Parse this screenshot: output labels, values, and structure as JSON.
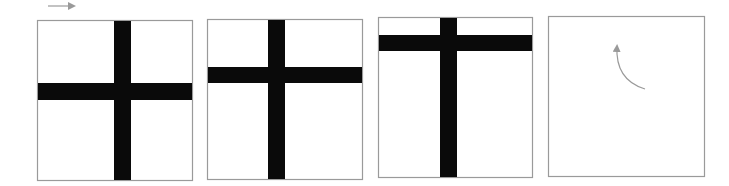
{
  "diagram": {
    "colors": {
      "background": "#ffffff",
      "panel_border": "#9a9a9a",
      "bar": "#0a0a0a",
      "arrow": "#9a9a9a"
    },
    "top_arrow": {
      "x1": 48,
      "y1": 6,
      "x2": 80,
      "y2": 6,
      "direction": "right"
    },
    "panels": [
      {
        "id": 1,
        "x": 37,
        "y": 20,
        "w": 155,
        "h": 160,
        "vbar": {
          "x": 114,
          "w": 17
        },
        "hbar": {
          "y": 83,
          "h": 17
        }
      },
      {
        "id": 2,
        "x": 207,
        "y": 19,
        "w": 155,
        "h": 160,
        "vbar": {
          "x": 268,
          "w": 17
        },
        "hbar": {
          "y": 67,
          "h": 16
        }
      },
      {
        "id": 3,
        "x": 378,
        "y": 17,
        "w": 154,
        "h": 160,
        "vbar": {
          "x": 440,
          "w": 17
        },
        "hbar": {
          "y": 35,
          "h": 16
        }
      },
      {
        "id": 4,
        "x": 548,
        "y": 16,
        "w": 156,
        "h": 160,
        "curved_arrow": {
          "start": [
            645,
            89
          ],
          "control": [
            615,
            80
          ],
          "end": [
            617,
            46
          ],
          "direction": "up"
        }
      }
    ]
  }
}
